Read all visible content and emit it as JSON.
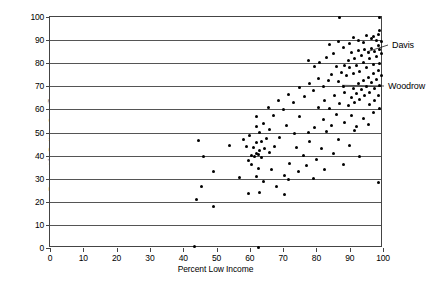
{
  "chart_data": {
    "type": "scatter",
    "title": "",
    "xlabel": "Percent Low Income",
    "ylabel": "Percent in Bottom Quartile",
    "xlim": [
      0,
      100
    ],
    "ylim": [
      0,
      100
    ],
    "xticks": [
      0,
      10,
      20,
      30,
      40,
      50,
      60,
      70,
      80,
      90,
      100
    ],
    "yticks": [
      0,
      10,
      20,
      30,
      40,
      50,
      60,
      70,
      80,
      90,
      100
    ],
    "grid": "horizontal",
    "legend": "none",
    "marker": "filled-circle",
    "marker_color": "#000000",
    "annotations": [
      {
        "label": "Davis",
        "x": 95.5,
        "y": 84.5,
        "label_x": 392,
        "label_y": 45
      },
      {
        "label": "Woodrow",
        "x": 88.0,
        "y": 70.0,
        "label_x": 388,
        "label_y": 86
      }
    ],
    "points": [
      [
        43.5,
        0.5
      ],
      [
        62.5,
        0.2
      ],
      [
        44.0,
        21.0
      ],
      [
        49.0,
        18.0
      ],
      [
        59.5,
        23.5
      ],
      [
        63.0,
        24.0
      ],
      [
        68.0,
        26.5
      ],
      [
        45.5,
        26.8
      ],
      [
        49.0,
        33.0
      ],
      [
        57.0,
        30.5
      ],
      [
        62.0,
        31.0
      ],
      [
        64.0,
        29.0
      ],
      [
        66.5,
        34.0
      ],
      [
        70.5,
        31.5
      ],
      [
        79.0,
        30.0
      ],
      [
        98.5,
        28.5
      ],
      [
        46.0,
        39.8
      ],
      [
        44.5,
        46.5
      ],
      [
        59.5,
        38.0
      ],
      [
        60.5,
        40.0
      ],
      [
        61.5,
        39.5
      ],
      [
        62.0,
        41.0
      ],
      [
        62.5,
        40.5
      ],
      [
        63.0,
        42.0
      ],
      [
        63.5,
        39.0
      ],
      [
        61.0,
        43.5
      ],
      [
        62.0,
        45.5
      ],
      [
        63.5,
        46.0
      ],
      [
        64.5,
        43.0
      ],
      [
        65.0,
        47.5
      ],
      [
        60.5,
        36.0
      ],
      [
        62.5,
        34.5
      ],
      [
        63.0,
        50.0
      ],
      [
        62.0,
        52.5
      ],
      [
        66.0,
        41.5
      ],
      [
        67.5,
        44.0
      ],
      [
        54.0,
        44.5
      ],
      [
        58.0,
        47.0
      ],
      [
        72.0,
        36.5
      ],
      [
        74.0,
        43.5
      ],
      [
        76.0,
        40.0
      ],
      [
        78.0,
        46.0
      ],
      [
        80.0,
        38.5
      ],
      [
        81.5,
        43.0
      ],
      [
        83.0,
        50.5
      ],
      [
        85.0,
        41.0
      ],
      [
        86.5,
        47.0
      ],
      [
        88.0,
        36.0
      ],
      [
        90.0,
        44.5
      ],
      [
        91.5,
        51.0
      ],
      [
        93.0,
        39.5
      ],
      [
        79.5,
        52.0
      ],
      [
        82.0,
        55.5
      ],
      [
        84.5,
        53.0
      ],
      [
        86.0,
        58.0
      ],
      [
        88.5,
        54.5
      ],
      [
        90.5,
        57.5
      ],
      [
        92.0,
        52.5
      ],
      [
        94.0,
        56.0
      ],
      [
        95.5,
        53.5
      ],
      [
        97.0,
        58.5
      ],
      [
        71.0,
        53.0
      ],
      [
        75.0,
        57.0
      ],
      [
        77.5,
        50.0
      ],
      [
        69.0,
        48.0
      ],
      [
        73.5,
        49.5
      ],
      [
        80.5,
        61.0
      ],
      [
        82.5,
        64.0
      ],
      [
        84.0,
        60.5
      ],
      [
        85.5,
        66.0
      ],
      [
        87.0,
        62.5
      ],
      [
        88.5,
        67.5
      ],
      [
        89.5,
        61.5
      ],
      [
        90.5,
        65.0
      ],
      [
        91.0,
        69.0
      ],
      [
        91.5,
        63.0
      ],
      [
        92.0,
        67.0
      ],
      [
        92.5,
        71.0
      ],
      [
        93.0,
        64.5
      ],
      [
        93.5,
        68.5
      ],
      [
        94.0,
        72.5
      ],
      [
        94.5,
        66.0
      ],
      [
        95.0,
        70.0
      ],
      [
        95.5,
        74.0
      ],
      [
        96.0,
        67.5
      ],
      [
        96.5,
        71.5
      ],
      [
        97.0,
        75.5
      ],
      [
        97.5,
        69.0
      ],
      [
        98.0,
        73.0
      ],
      [
        98.5,
        77.0
      ],
      [
        99.0,
        70.5
      ],
      [
        99.5,
        74.5
      ],
      [
        96.0,
        62.0
      ],
      [
        97.5,
        64.0
      ],
      [
        98.5,
        66.0
      ],
      [
        99.0,
        60.5
      ],
      [
        86.5,
        72.0
      ],
      [
        88.0,
        70.0
      ],
      [
        89.0,
        74.5
      ],
      [
        90.0,
        78.0
      ],
      [
        91.0,
        75.5
      ],
      [
        92.0,
        79.0
      ],
      [
        93.0,
        76.5
      ],
      [
        94.0,
        80.5
      ],
      [
        95.0,
        78.0
      ],
      [
        96.0,
        82.0
      ],
      [
        97.0,
        79.5
      ],
      [
        98.0,
        83.0
      ],
      [
        99.0,
        80.0
      ],
      [
        99.5,
        84.0
      ],
      [
        95.5,
        84.5
      ],
      [
        96.5,
        86.5
      ],
      [
        97.5,
        85.0
      ],
      [
        98.5,
        87.5
      ],
      [
        99.0,
        86.0
      ],
      [
        94.5,
        86.0
      ],
      [
        93.5,
        83.5
      ],
      [
        92.5,
        85.5
      ],
      [
        91.5,
        82.0
      ],
      [
        90.5,
        84.5
      ],
      [
        89.5,
        81.0
      ],
      [
        88.5,
        79.0
      ],
      [
        87.5,
        76.0
      ],
      [
        86.0,
        78.5
      ],
      [
        84.5,
        75.0
      ],
      [
        83.5,
        72.5
      ],
      [
        82.0,
        70.0
      ],
      [
        80.5,
        73.5
      ],
      [
        79.0,
        68.0
      ],
      [
        78.0,
        71.0
      ],
      [
        76.5,
        65.5
      ],
      [
        75.0,
        69.5
      ],
      [
        73.0,
        63.0
      ],
      [
        71.5,
        66.5
      ],
      [
        70.0,
        60.0
      ],
      [
        68.5,
        64.0
      ],
      [
        67.0,
        57.5
      ],
      [
        65.5,
        61.0
      ],
      [
        87.0,
        100.0
      ],
      [
        99.0,
        100.0
      ],
      [
        92.5,
        90.0
      ],
      [
        96.5,
        90.5
      ],
      [
        98.0,
        90.0
      ],
      [
        99.5,
        89.5
      ],
      [
        94.0,
        89.0
      ],
      [
        97.0,
        91.5
      ],
      [
        98.5,
        92.5
      ],
      [
        99.0,
        94.0
      ],
      [
        95.0,
        92.0
      ],
      [
        81.0,
        80.5
      ],
      [
        83.0,
        82.5
      ],
      [
        85.0,
        84.0
      ],
      [
        79.5,
        78.5
      ],
      [
        77.5,
        81.0
      ],
      [
        84.0,
        88.0
      ],
      [
        86.5,
        89.5
      ],
      [
        88.0,
        87.0
      ],
      [
        90.0,
        88.5
      ],
      [
        91.0,
        91.0
      ],
      [
        62.0,
        57.0
      ],
      [
        64.0,
        54.0
      ],
      [
        66.0,
        51.5
      ],
      [
        60.0,
        48.5
      ],
      [
        59.0,
        44.0
      ],
      [
        70.5,
        23.0
      ],
      [
        71.5,
        29.5
      ],
      [
        74.5,
        33.0
      ],
      [
        77.0,
        35.5
      ],
      [
        82.5,
        34.0
      ]
    ]
  },
  "axis": {
    "x_tick_labels": [
      "0",
      "10",
      "20",
      "30",
      "40",
      "50",
      "60",
      "70",
      "80",
      "90",
      "100"
    ],
    "y_tick_labels": [
      "0",
      "10",
      "20",
      "30",
      "40",
      "50",
      "60",
      "70",
      "80",
      "90",
      "100"
    ]
  }
}
